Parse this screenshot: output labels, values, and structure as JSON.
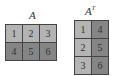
{
  "matrices": [
    {
      "name": "A",
      "rows": [
        [
          1,
          2,
          3
        ],
        [
          4,
          5,
          6
        ]
      ],
      "row_colors": [
        "#b4b4b4",
        "#858585"
      ]
    },
    {
      "name": "A",
      "superscript": "T",
      "rows": [
        [
          1,
          4
        ],
        [
          2,
          5
        ],
        [
          3,
          6
        ]
      ],
      "col_colors": [
        "#b4b4b4",
        "#858585"
      ]
    }
  ],
  "labels": {
    "a": "A",
    "at_base": "A",
    "at_sup": "T"
  },
  "cells_a": [
    "1",
    "2",
    "3",
    "4",
    "5",
    "6"
  ],
  "cells_at": [
    "1",
    "4",
    "2",
    "5",
    "3",
    "6"
  ]
}
